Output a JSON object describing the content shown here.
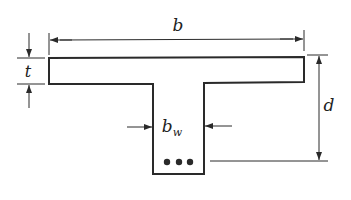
{
  "diagram": {
    "labels": {
      "flange_width": "b",
      "flange_thickness": "t",
      "effective_depth": "d",
      "web_width_main": "b",
      "web_width_sub": "w"
    },
    "reinforcement_bars": 3,
    "colors": {
      "stroke": "#2a2a2a",
      "background": "#ffffff"
    }
  }
}
